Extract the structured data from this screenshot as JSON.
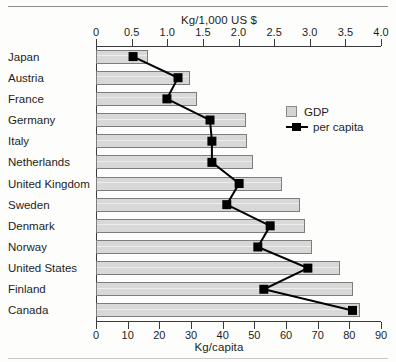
{
  "chart_data": {
    "type": "bar",
    "title": "",
    "orientation": "horizontal",
    "categories": [
      "Japan",
      "Austria",
      "France",
      "Germany",
      "Italy",
      "Netherlands",
      "United Kingdom",
      "Sweden",
      "Denmark",
      "Norway",
      "United States",
      "Finland",
      "Canada"
    ],
    "series": [
      {
        "name": "GDP",
        "unit": "Kg/1,000 US $",
        "axis": "top",
        "type": "bar",
        "color": "#d8d8d8",
        "values": [
          0.73,
          1.32,
          1.42,
          2.11,
          2.12,
          2.2,
          2.61,
          2.86,
          2.93,
          3.03,
          3.43,
          3.6,
          3.7
        ]
      },
      {
        "name": "per capita",
        "unit": "Kg/capita",
        "axis": "bottom",
        "type": "line",
        "color": "#000000",
        "values": [
          11.7,
          25.9,
          22.4,
          36.0,
          36.6,
          36.6,
          45.2,
          41.3,
          55.0,
          51.1,
          66.9,
          53.0,
          81.0
        ]
      }
    ],
    "top_axis": {
      "label": "Kg/1,000 US $",
      "ticks": [
        "0",
        "0.5",
        "1.0",
        "1.5",
        "2.0",
        "2.5",
        "3.0",
        "3.5",
        "4.0"
      ],
      "min": 0,
      "max": 4.0,
      "step": 0.5
    },
    "bottom_axis": {
      "label": "Kg/capita",
      "ticks": [
        "0",
        "10",
        "20",
        "30",
        "40",
        "50",
        "60",
        "70",
        "80",
        "90"
      ],
      "min": 0,
      "max": 90,
      "step": 10
    },
    "legend": {
      "position": "inside-right-top",
      "entries": [
        {
          "label": "GDP",
          "marker": "gdp-swatch"
        },
        {
          "label": "per capita",
          "marker": "per-capita-marker"
        }
      ]
    },
    "grid": false
  }
}
